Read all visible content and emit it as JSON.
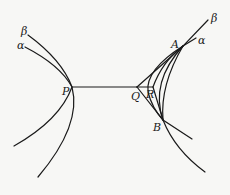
{
  "figure": {
    "labels": {
      "beta_left": "β",
      "alpha_left": "α",
      "P": "P",
      "Q": "Q",
      "R": "R",
      "A": "A",
      "B": "B",
      "beta_right": "β",
      "alpha_right": "α"
    },
    "stroke_color": "#1a1a1a",
    "background_color": "#f7f7f5"
  }
}
